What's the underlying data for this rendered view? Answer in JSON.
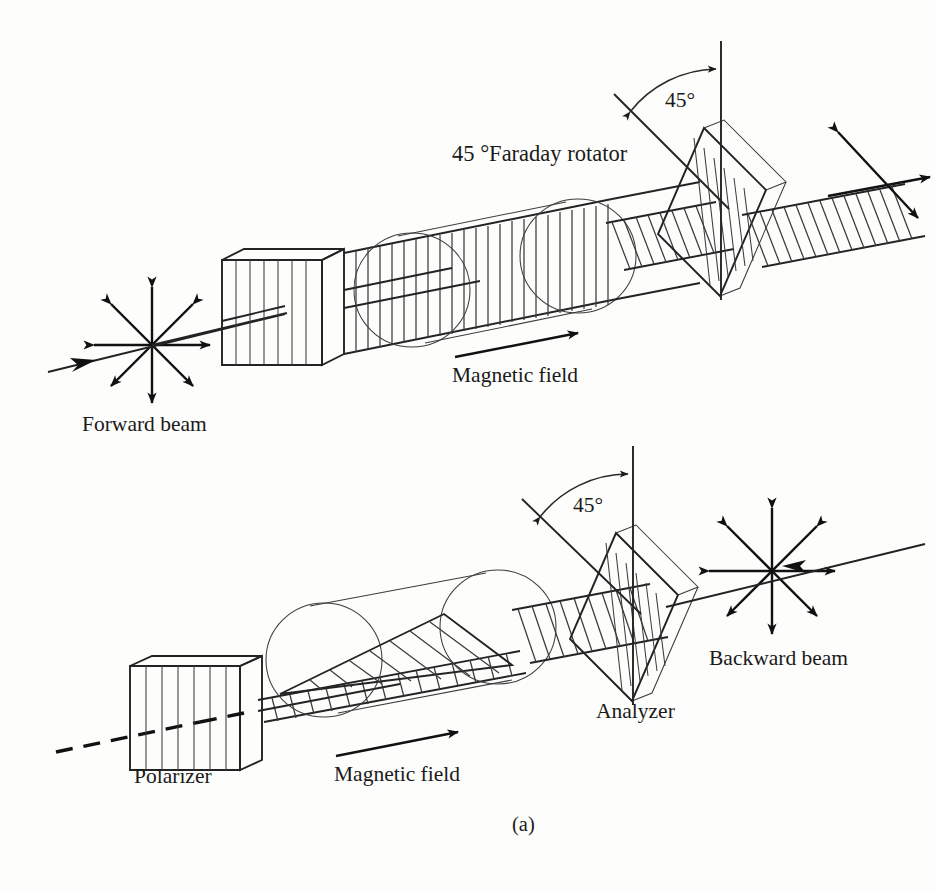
{
  "figure": {
    "caption": "(a)",
    "title_note": "Faraday rotator optical isolator — forward and backward propagation",
    "ink_color": "#111111",
    "background_color": "#fdfdfc"
  },
  "panels": [
    {
      "id": "forward",
      "name": "forward-propagation-panel",
      "labels": {
        "rotator": "45 °Faraday rotator",
        "angle": "45°",
        "magnetic_field": "Magnetic field",
        "beam": "Forward beam"
      },
      "components": [
        {
          "name": "unpolarized-beam-star",
          "rays": 8
        },
        {
          "name": "polarizer-block",
          "grating": "vertical",
          "grating_lines": 7
        },
        {
          "name": "vertically-polarized-beam",
          "hatch": "vertical"
        },
        {
          "name": "faraday-rotator-cylinder",
          "circles": 2
        },
        {
          "name": "rotated-beam-45",
          "hatch": "diagonal"
        },
        {
          "name": "analyzer-block",
          "grating": "diagonal-45"
        },
        {
          "name": "transmitted-beam",
          "hatch": "diagonal"
        },
        {
          "name": "magnetic-field-arrow",
          "direction": "right"
        }
      ]
    },
    {
      "id": "backward",
      "name": "backward-propagation-panel",
      "labels": {
        "angle": "45°",
        "magnetic_field": "Magnetic field",
        "analyzer": "Analyzer",
        "polarizer": "Polarizer",
        "beam": "Backward beam"
      },
      "components": [
        {
          "name": "unpolarized-beam-star",
          "rays": 8
        },
        {
          "name": "analyzer-block",
          "grating": "diagonal-45"
        },
        {
          "name": "rotated-beam-45",
          "hatch": "diagonal"
        },
        {
          "name": "faraday-rotator-cylinder",
          "circles": 2
        },
        {
          "name": "horizontally-rotated-beam",
          "hatch": "diagonal"
        },
        {
          "name": "polarizer-block",
          "grating": "vertical",
          "grating_lines": 7
        },
        {
          "name": "blocked-beam-dashed",
          "style": "dashed"
        },
        {
          "name": "magnetic-field-arrow",
          "direction": "right"
        }
      ]
    }
  ],
  "text_positions": {
    "rotator_label": {
      "x": 452,
      "y": 161
    },
    "angle_top": {
      "x": 665,
      "y": 107
    },
    "magnetic_field_top": {
      "x": 452,
      "y": 382
    },
    "forward_beam": {
      "x": 82,
      "y": 431
    },
    "angle_bottom": {
      "x": 573,
      "y": 512
    },
    "backward_beam": {
      "x": 709,
      "y": 665
    },
    "analyzer_label": {
      "x": 596,
      "y": 718
    },
    "magnetic_field_bot": {
      "x": 334,
      "y": 781
    },
    "polarizer_label": {
      "x": 134,
      "y": 783
    },
    "caption": {
      "x": 512,
      "y": 831
    }
  }
}
